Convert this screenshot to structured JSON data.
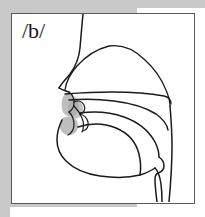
{
  "figure": {
    "phoneme_label": "/b/",
    "diagram_name": "sagittal-vocal-tract-diagram",
    "frame_border_color": "#5a5a5a",
    "background_color": "#c9c9c9",
    "panel_color": "#ffffff",
    "outline_color": "#1a1a1a",
    "constriction_shade_color": "#a8a8a8"
  },
  "anatomy": {
    "parts": [
      {
        "id": "facial-profile",
        "label": "Facial profile (forehead, nose, lips, chin)"
      },
      {
        "id": "nasal-cavity",
        "label": "Nasal cavity"
      },
      {
        "id": "hard-palate",
        "label": "Hard palate"
      },
      {
        "id": "soft-palate",
        "label": "Soft palate (velum)"
      },
      {
        "id": "tongue-body",
        "label": "Tongue"
      },
      {
        "id": "upper-lip",
        "label": "Upper lip"
      },
      {
        "id": "lower-lip",
        "label": "Lower lip"
      },
      {
        "id": "teeth",
        "label": "Teeth"
      },
      {
        "id": "jaw-chin",
        "label": "Jaw and chin"
      },
      {
        "id": "pharyngeal-wall",
        "label": "Pharyngeal wall"
      },
      {
        "id": "larynx",
        "label": "Larynx"
      },
      {
        "id": "constriction-shading",
        "label": "Bilabial closure shading"
      }
    ]
  }
}
